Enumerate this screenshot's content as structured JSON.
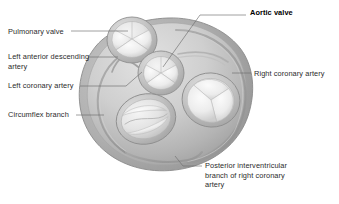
{
  "figure": {
    "type": "anatomical-diagram",
    "view": "superior view with atria removed",
    "style": "grayscale medical illustration",
    "colors": {
      "background": "#ffffff",
      "myocardium_light": "#d8d8d8",
      "myocardium_mid": "#bcbcbc",
      "myocardium_dark": "#9a9a9a",
      "valve_leaflet_light": "#efefef",
      "valve_leaflet_shadow": "#c4c4c4",
      "outline": "#8a8a8a",
      "leader_line": "#6e6e6e",
      "text": "#2b2b2b",
      "text_emphasis": "#000000"
    }
  },
  "labels": [
    {
      "id": "pulmonary-valve",
      "text": "Pulmonary valve",
      "side": "left",
      "emphasis": false
    },
    {
      "id": "left-anterior-descending-artery",
      "text": "Left anterior descending\nartery",
      "side": "left",
      "emphasis": false
    },
    {
      "id": "left-coronary-artery",
      "text": "Left coronary artery",
      "side": "left",
      "emphasis": false
    },
    {
      "id": "circumflex-branch",
      "text": "Circumflex branch",
      "side": "left",
      "emphasis": false
    },
    {
      "id": "aortic-valve",
      "text": "Aortic valve",
      "side": "right",
      "emphasis": true
    },
    {
      "id": "right-coronary-artery",
      "text": "Right coronary artery",
      "side": "right",
      "emphasis": false
    },
    {
      "id": "posterior-interventricular-branch",
      "text": "Posterior interventricular\nbranch of right coronary\nartery",
      "side": "right",
      "emphasis": false
    }
  ],
  "structures": [
    {
      "id": "pulmonary-valve-structure",
      "name": "Pulmonary valve",
      "leaflets": 3,
      "shape": "round"
    },
    {
      "id": "aortic-valve-structure",
      "name": "Aortic valve",
      "leaflets": 3,
      "shape": "round"
    },
    {
      "id": "mitral-valve-structure",
      "name": "Mitral valve",
      "leaflets": 2,
      "shape": "oval"
    },
    {
      "id": "tricuspid-valve-structure",
      "name": "Tricuspid valve",
      "leaflets": 3,
      "shape": "round"
    },
    {
      "id": "coronary-groove",
      "name": "Atrioventricular groove",
      "leaflets": 0,
      "shape": "arc"
    }
  ]
}
